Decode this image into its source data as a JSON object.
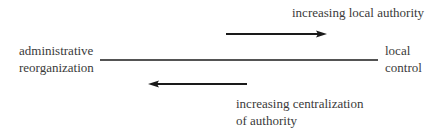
{
  "diagram": {
    "top_label": "increasing local authority",
    "left_label": {
      "line1": "administrative",
      "line2": "reorganization"
    },
    "right_label": {
      "line1": "local",
      "line2": "control"
    },
    "bottom_label": {
      "line1": "increasing centralization",
      "line2": "of authority"
    },
    "colors": {
      "text": "#3a3a3a",
      "line": "#1a1a1a",
      "background": "#ffffff"
    },
    "axis": {
      "x_start": 100,
      "x_end": 378,
      "y": 60
    },
    "arrows": [
      {
        "name": "increasing-local-authority",
        "direction": "right",
        "x1": 226,
        "x2": 327,
        "y": 34
      },
      {
        "name": "increasing-centralization",
        "direction": "left",
        "x1": 247,
        "x2": 148,
        "y": 84
      }
    ]
  }
}
